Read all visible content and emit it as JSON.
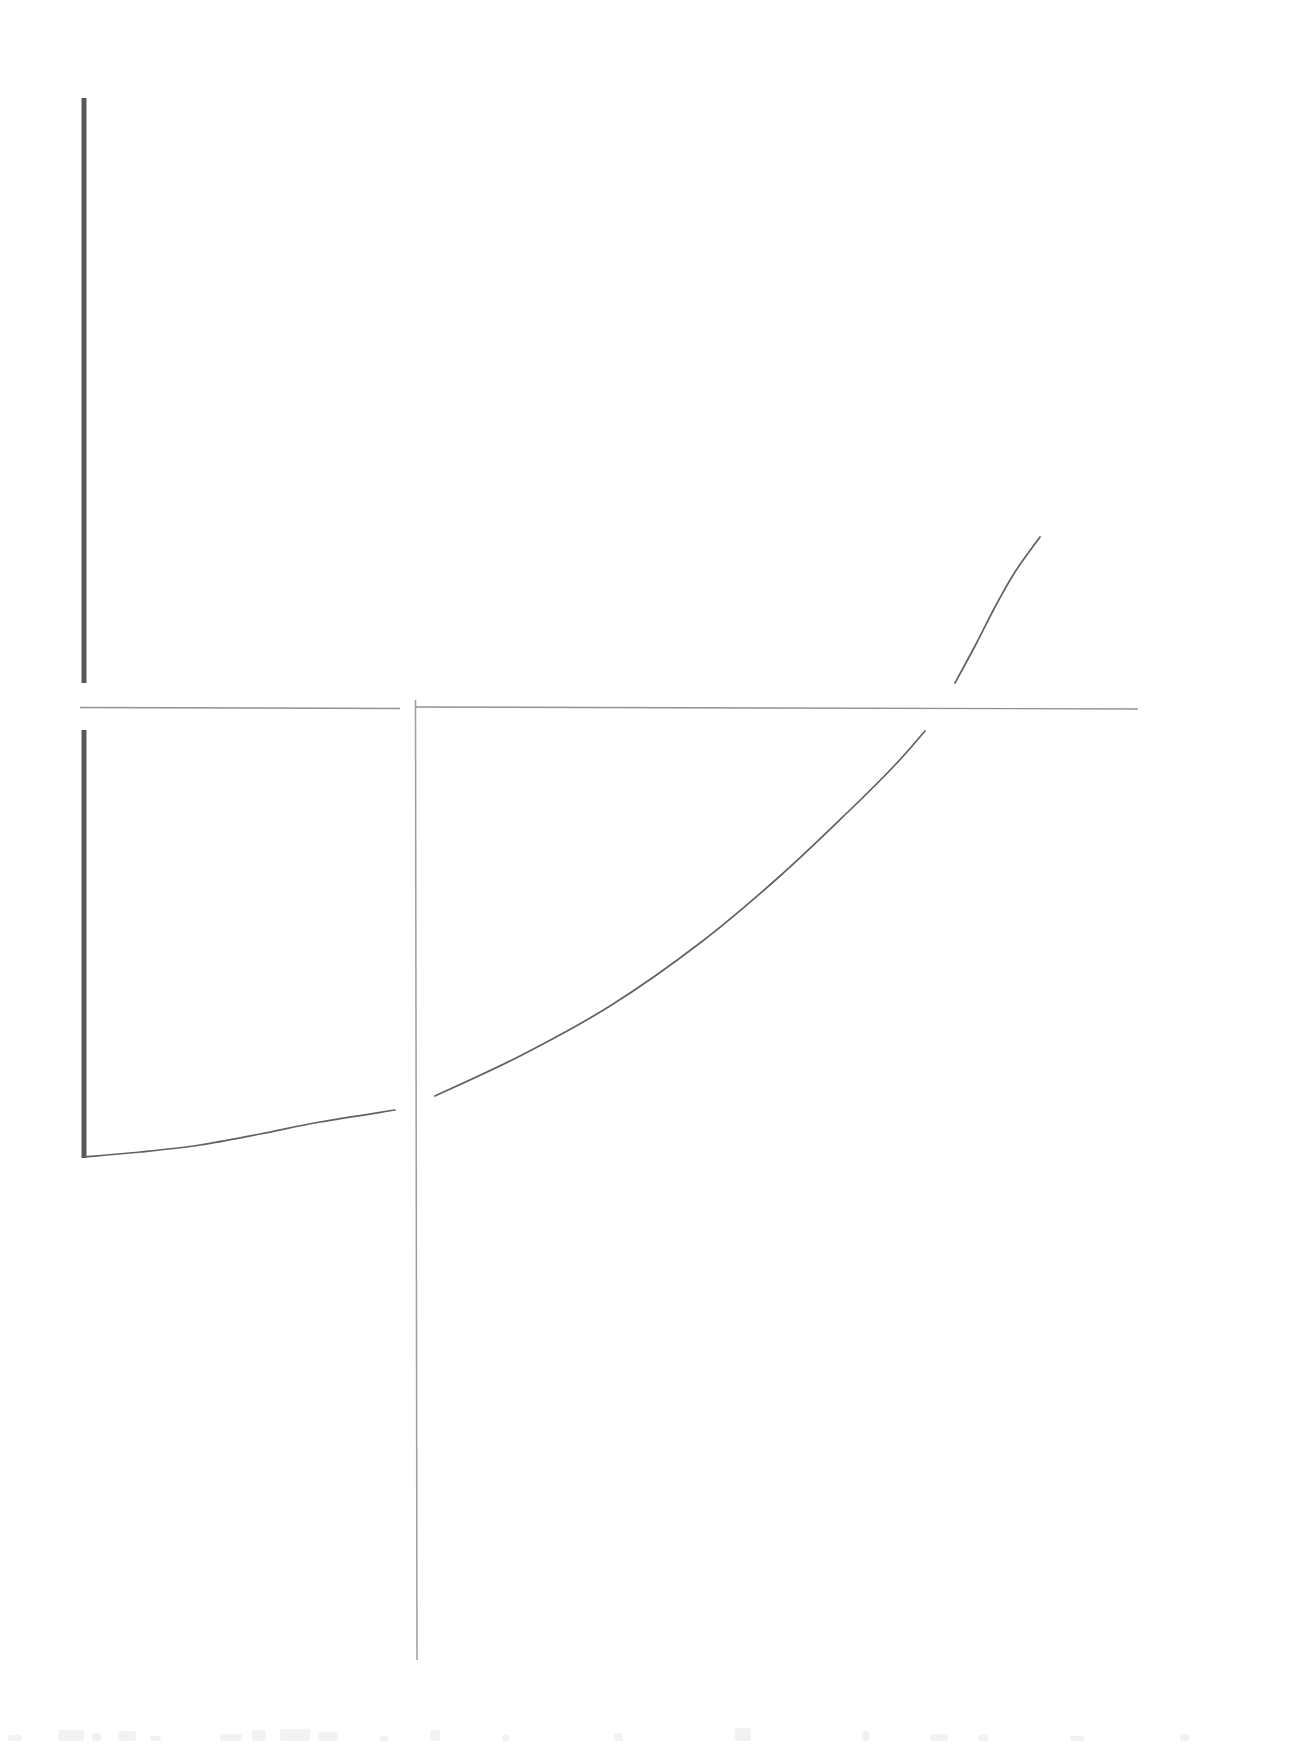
{
  "page": {
    "background_color": "#ffffff",
    "width": 1305,
    "height": 1748
  },
  "colors": {
    "axis_thick": "#55585c",
    "axis_thin": "#8e9195",
    "curve": "#5e6165",
    "smudge": "#f2f2f3",
    "background": "#ffffff"
  },
  "bottom_artifact": {
    "label": "faint-ink-residue",
    "text": ""
  },
  "chart_data": {
    "type": "line",
    "title": "",
    "subtitle": "",
    "xlabel": "",
    "ylabel": "",
    "grid": false,
    "legend": null,
    "axes": [
      {
        "name": "upper-panel",
        "vertical_rule": {
          "x": 84,
          "y_top": 98,
          "y_bottom": 683,
          "weight": "thick"
        },
        "horizontal_rule": {
          "y": 708,
          "x_left": 80,
          "x_right": 400,
          "weight": "thin"
        }
      },
      {
        "name": "lower-panel",
        "vertical_rule": {
          "x": 84,
          "y_top": 730,
          "y_bottom": 1158,
          "weight": "thick"
        },
        "horizontal_rule": {
          "y": 708,
          "x_left": 415,
          "x_right": 1138,
          "weight": "thin"
        },
        "tall_vertical_rule": {
          "x": 415,
          "y_top": 700,
          "y_bottom": 1660,
          "weight": "thin"
        }
      }
    ],
    "series": [
      {
        "name": "lower-left-fragment",
        "description": "shallow concave-up fragment rising left-to-right inside the small lower-left panel",
        "points": [
          [
            84,
            1157
          ],
          [
            140,
            1152
          ],
          [
            200,
            1145
          ],
          [
            260,
            1134
          ],
          [
            320,
            1122
          ],
          [
            395,
            1110
          ]
        ]
      },
      {
        "name": "main-curve",
        "description": "long concave-up exponential-like curve spanning the lower-right panel",
        "points": [
          [
            435,
            1096
          ],
          [
            520,
            1056
          ],
          [
            610,
            1006
          ],
          [
            700,
            943
          ],
          [
            780,
            876
          ],
          [
            850,
            810
          ],
          [
            895,
            765
          ],
          [
            925,
            731
          ]
        ]
      },
      {
        "name": "upper-right-fragment",
        "description": "steep near-linear fragment above the horizontal rule at the right edge",
        "points": [
          [
            955,
            683
          ],
          [
            975,
            646
          ],
          [
            995,
            607
          ],
          [
            1015,
            572
          ],
          [
            1040,
            537
          ]
        ]
      }
    ],
    "xlim": [
      0,
      1305
    ],
    "ylim": [
      1748,
      0
    ]
  }
}
